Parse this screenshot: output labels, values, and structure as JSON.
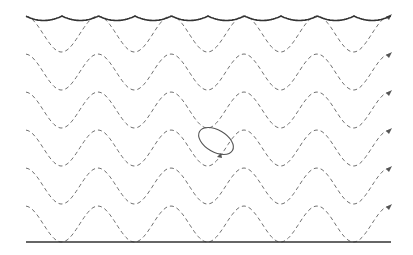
{
  "diagram": {
    "title": "",
    "colors": {
      "surface": "#333333",
      "bottom": "#333333",
      "dashed_paths": "#707070",
      "orbit": "#555555"
    },
    "surface": {
      "y": 16,
      "x_start": 26,
      "x_end": 391,
      "cusp_spacing": 36.5
    },
    "seabed": {
      "y": 242,
      "x_start": 26,
      "x_end": 391
    },
    "wave_paths": {
      "count": 6,
      "crest_y": [
        16,
        54,
        92,
        130,
        168,
        206
      ],
      "amplitude": 36,
      "period": 73,
      "x_start": 26,
      "x_end": 391,
      "arrow_at_end": true
    },
    "orbit": {
      "cx": 216,
      "cy": 141,
      "rx": 19,
      "ry": 11,
      "rotation_deg": 30
    }
  }
}
